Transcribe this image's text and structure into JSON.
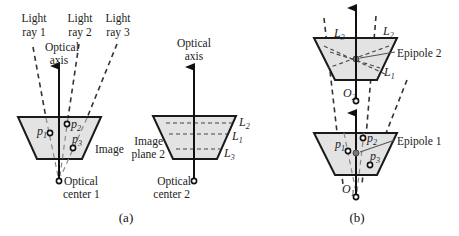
{
  "figure": {
    "panel_a": {
      "caption": "(a)",
      "camera1": {
        "light_rays": [
          {
            "line1": "Light",
            "line2": "ray 1"
          },
          {
            "line1": "Light",
            "line2": "ray 2"
          },
          {
            "line1": "Light",
            "line2": "ray 3"
          }
        ],
        "optical_axis": {
          "line1": "Optical",
          "line2": "axis"
        },
        "points": [
          {
            "base": "p",
            "sub": "1"
          },
          {
            "base": "p",
            "sub": "2"
          },
          {
            "base": "p",
            "sub": "3"
          }
        ],
        "image_label": "Image",
        "optical_center": {
          "line1": "Optical",
          "line2": "center 1"
        }
      },
      "camera2": {
        "optical_axis": {
          "line1": "Optical",
          "line2": "axis"
        },
        "epipolar_lines": [
          {
            "base": "L",
            "sub": "2"
          },
          {
            "base": "L",
            "sub": "1"
          },
          {
            "base": "L",
            "sub": "3"
          }
        ],
        "image_plane_label": {
          "line1": "Image",
          "line2": "plane 2"
        },
        "optical_center": {
          "line1": "Optical",
          "line2": "center 2"
        }
      }
    },
    "panel_b": {
      "caption": "(b)",
      "top_camera": {
        "epipolar_lines": [
          {
            "base": "L",
            "sub": "3"
          },
          {
            "base": "L",
            "sub": "2"
          },
          {
            "base": "L",
            "sub": "1"
          }
        ],
        "epipole_label": "Epipole 2",
        "center": {
          "base": "O",
          "sub": "2"
        }
      },
      "bottom_camera": {
        "points": [
          {
            "base": "p",
            "sub": "1"
          },
          {
            "base": "p",
            "sub": "2"
          },
          {
            "base": "p",
            "sub": "3"
          }
        ],
        "epipole_label": "Epipole 1",
        "center": {
          "base": "O",
          "sub": "1"
        }
      }
    },
    "colors": {
      "plane_fill": "#e3e3e3",
      "stroke": "#1a1a1a",
      "epipole_fill": "#777777"
    }
  }
}
